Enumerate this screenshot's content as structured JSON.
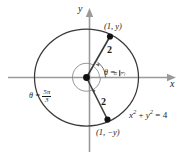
{
  "figure": {
    "kind": "unit-circle-diagram",
    "background": "#ffffff",
    "axis_color": "#9a9a9a",
    "curve_color": "#3a3a3a",
    "text_color": "#1b1b1b",
    "axes": {
      "x_label": "x",
      "y_label": "y"
    },
    "circle": {
      "equation_lhs": "x",
      "equation": "x2 + y2 = 4",
      "radius_value": "2",
      "center": "origin"
    },
    "points": [
      {
        "id": "upper",
        "label": "(1, y)",
        "radius_label": "2"
      },
      {
        "id": "lower",
        "label": "(1, −y)",
        "radius_label": "2"
      }
    ],
    "angles": [
      {
        "id": "theta-upper",
        "symbol": "θ",
        "equals": "=",
        "numerator": "π",
        "denominator": "3",
        "text": "θ = π/3"
      },
      {
        "id": "theta-lower",
        "symbol": "θ",
        "equals": "=",
        "numerator": "5π",
        "denominator": "3",
        "text": "θ = 5π/3"
      }
    ],
    "equation_parts": {
      "x": "x",
      "x_exp": "2",
      "plus": "+",
      "y": "y",
      "y_exp": "2",
      "eq": "=",
      "four": "4"
    }
  }
}
